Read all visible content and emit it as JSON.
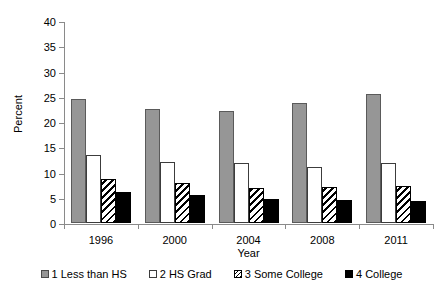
{
  "chart_data": {
    "type": "bar",
    "title": "",
    "xlabel": "Year",
    "ylabel": "Percent",
    "categories": [
      "1996",
      "2000",
      "2004",
      "2008",
      "2011"
    ],
    "ylim": [
      0,
      40
    ],
    "yticks": [
      0,
      5,
      10,
      15,
      20,
      25,
      30,
      35,
      40
    ],
    "grid": false,
    "legend_position": "bottom",
    "series": [
      {
        "name": "1 Less than HS",
        "values": [
          24.6,
          22.6,
          22.1,
          23.7,
          25.5
        ]
      },
      {
        "name": "2 HS Grad",
        "values": [
          13.5,
          12.0,
          11.8,
          11.1,
          11.9
        ]
      },
      {
        "name": "3 Some College",
        "values": [
          8.8,
          7.9,
          6.9,
          7.2,
          7.4
        ]
      },
      {
        "name": "4 College",
        "values": [
          6.2,
          5.6,
          4.7,
          4.6,
          4.3
        ]
      }
    ],
    "colors": {
      "series_0": "#969696",
      "series_1": "#ffffff",
      "series_2": "#000000",
      "series_3": "#000000",
      "axis": "#8a8a8a",
      "text": "#000000"
    }
  }
}
